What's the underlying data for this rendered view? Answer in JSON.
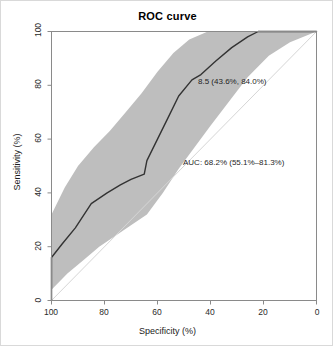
{
  "chart_data": {
    "type": "line",
    "title": "ROC curve",
    "xlabel": "Specificity (%)",
    "ylabel": "Sensitivity (%)",
    "xlim": [
      100,
      0
    ],
    "ylim": [
      0,
      100
    ],
    "x_reversed": true,
    "grid": false,
    "legend": "none",
    "xticks": [
      "100",
      "80",
      "60",
      "40",
      "20",
      "0"
    ],
    "xtick_values": [
      100,
      80,
      60,
      40,
      20,
      0
    ],
    "yticks": [
      "0",
      "20",
      "40",
      "60",
      "80",
      "100"
    ],
    "ytick_values": [
      0,
      20,
      40,
      60,
      80,
      100
    ],
    "series": [
      {
        "name": "ROC curve",
        "color": "#333333",
        "points": [
          {
            "specificity": 100,
            "sensitivity": 0
          },
          {
            "specificity": 100,
            "sensitivity": 16
          },
          {
            "specificity": 96,
            "sensitivity": 21
          },
          {
            "specificity": 91,
            "sensitivity": 27
          },
          {
            "specificity": 85,
            "sensitivity": 36
          },
          {
            "specificity": 79,
            "sensitivity": 40
          },
          {
            "specificity": 74,
            "sensitivity": 43
          },
          {
            "specificity": 70,
            "sensitivity": 45
          },
          {
            "specificity": 65,
            "sensitivity": 47
          },
          {
            "specificity": 64,
            "sensitivity": 52
          },
          {
            "specificity": 60,
            "sensitivity": 60
          },
          {
            "specificity": 56,
            "sensitivity": 68
          },
          {
            "specificity": 52,
            "sensitivity": 76
          },
          {
            "specificity": 47,
            "sensitivity": 82
          },
          {
            "specificity": 43.6,
            "sensitivity": 84
          },
          {
            "specificity": 38,
            "sensitivity": 89
          },
          {
            "specificity": 32,
            "sensitivity": 94
          },
          {
            "specificity": 26,
            "sensitivity": 98
          },
          {
            "specificity": 22,
            "sensitivity": 100
          },
          {
            "specificity": 0,
            "sensitivity": 100
          }
        ]
      },
      {
        "name": "Confidence interval upper bound",
        "color": "#bebebe",
        "points": [
          {
            "specificity": 100,
            "sensitivity": 32
          },
          {
            "specificity": 95,
            "sensitivity": 42
          },
          {
            "specificity": 90,
            "sensitivity": 50
          },
          {
            "specificity": 84,
            "sensitivity": 57
          },
          {
            "specificity": 78,
            "sensitivity": 63
          },
          {
            "specificity": 72,
            "sensitivity": 70
          },
          {
            "specificity": 66,
            "sensitivity": 77
          },
          {
            "specificity": 60,
            "sensitivity": 85
          },
          {
            "specificity": 54,
            "sensitivity": 92
          },
          {
            "specificity": 48,
            "sensitivity": 97
          },
          {
            "specificity": 41,
            "sensitivity": 100
          },
          {
            "specificity": 0,
            "sensitivity": 100
          }
        ]
      },
      {
        "name": "Confidence interval lower bound",
        "color": "#bebebe",
        "points": [
          {
            "specificity": 100,
            "sensitivity": 4
          },
          {
            "specificity": 94,
            "sensitivity": 10
          },
          {
            "specificity": 88,
            "sensitivity": 15
          },
          {
            "specificity": 82,
            "sensitivity": 20
          },
          {
            "specificity": 76,
            "sensitivity": 24
          },
          {
            "specificity": 70,
            "sensitivity": 28
          },
          {
            "specificity": 64,
            "sensitivity": 32
          },
          {
            "specificity": 58,
            "sensitivity": 40
          },
          {
            "specificity": 52,
            "sensitivity": 49
          },
          {
            "specificity": 46,
            "sensitivity": 57
          },
          {
            "specificity": 40,
            "sensitivity": 65
          },
          {
            "specificity": 33,
            "sensitivity": 74
          },
          {
            "specificity": 26,
            "sensitivity": 83
          },
          {
            "specificity": 18,
            "sensitivity": 91
          },
          {
            "specificity": 10,
            "sensitivity": 96
          },
          {
            "specificity": 0,
            "sensitivity": 100
          }
        ]
      }
    ],
    "reference_line": {
      "name": "chance-diagonal",
      "color": "#d6d6d6",
      "from": {
        "specificity": 100,
        "sensitivity": 0
      },
      "to": {
        "specificity": 0,
        "sensitivity": 100
      }
    },
    "annotations": [
      {
        "name": "threshold",
        "text": "8.5 (43.6%, 84.0%)",
        "threshold": 8.5,
        "specificity": 43.6,
        "sensitivity": 84.0
      },
      {
        "name": "auc",
        "text": "AUC: 68.2% (55.1%–81.3%)",
        "auc": 68.2,
        "ci_low": 55.1,
        "ci_high": 81.3
      }
    ]
  },
  "chart": {
    "title": "ROC curve",
    "xlabel": "Specificity (%)",
    "ylabel": "Sensitivity (%)",
    "threshold_label": "8.5 (43.6%, 84.0%)",
    "auc_label": "AUC: 68.2% (55.1%–81.3%)",
    "xticks": {
      "t0": "100",
      "t1": "80",
      "t2": "60",
      "t3": "40",
      "t4": "20",
      "t5": "0"
    },
    "yticks": {
      "t0": "0",
      "t1": "20",
      "t2": "40",
      "t3": "60",
      "t4": "80",
      "t5": "100"
    },
    "colors": {
      "curve": "#333333",
      "band": "#bebebe",
      "diagonal": "#d6d6d6",
      "axis": "#8a8a8a",
      "text": "#1a1a1a"
    }
  }
}
